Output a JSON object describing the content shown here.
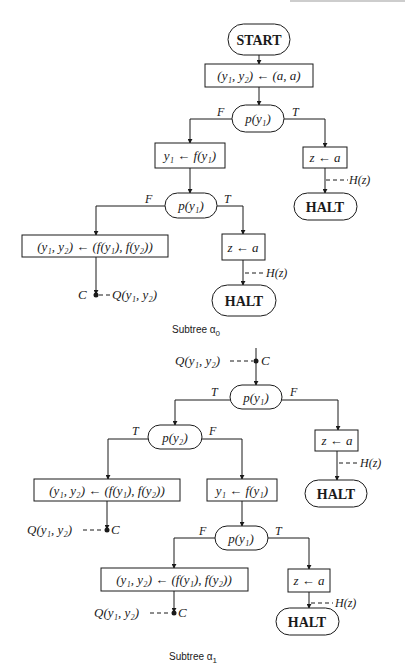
{
  "header_fragment": "",
  "subtree0": {
    "caption": "Subtree α",
    "caption_sub": "0",
    "start": "START",
    "assign": "(y₁, y₂) ← (a, a)",
    "test1": "p(y₁)",
    "test1_false": "F",
    "test1_true": "T",
    "step1": "y₁ ← f(y₁)",
    "z_assign1": "z ← a",
    "h_label1": "H(z)",
    "halt1": "HALT",
    "test2": "p(y₁)",
    "test2_false": "F",
    "test2_true": "T",
    "big_assign": "(y₁, y₂) ← (f(y₁), f(y₂))",
    "z_assign2": "z ← a",
    "h_label2": "H(z)",
    "halt2": "HALT",
    "cut_label": "C",
    "cut_predicate": "Q(y₁, y₂)"
  },
  "subtree1": {
    "caption": "Subtree α",
    "caption_sub": "1",
    "entry_predicate": "Q(y₁, y₂)",
    "entry_label": "C",
    "test1": "p(y₁)",
    "test1_true": "T",
    "test1_false": "F",
    "test2": "p(y₂)",
    "test2_true": "T",
    "test2_false": "F",
    "z_assign1": "z ← a",
    "h_label1": "H(z)",
    "halt1": "HALT",
    "big_assign1": "(y₁, y₂) ← (f(y₁), f(y₂))",
    "cut1_predicate": "Q(y₁, y₂)",
    "cut1_label": "C",
    "step1": "y₁ ← f(y₁)",
    "test3": "p(y₁)",
    "test3_false": "F",
    "test3_true": "T",
    "big_assign2": "(y₁, y₂) ← (f(y₁), f(y₂))",
    "cut2_predicate": "Q(y₁, y₂)",
    "cut2_label": "C",
    "z_assign2": "z ← a",
    "h_label2": "H(z)",
    "halt2": "HALT"
  }
}
